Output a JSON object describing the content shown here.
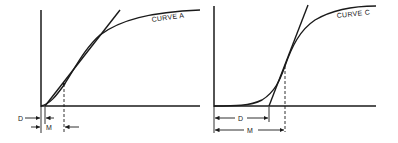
{
  "figure": {
    "panels": [
      {
        "id": "left",
        "curve_label": "CURVE A",
        "dim_label_d": "D",
        "dim_label_m": "M"
      },
      {
        "id": "right",
        "curve_label": "CURVE C",
        "dim_label_d": "D",
        "dim_label_m": "M"
      }
    ]
  }
}
